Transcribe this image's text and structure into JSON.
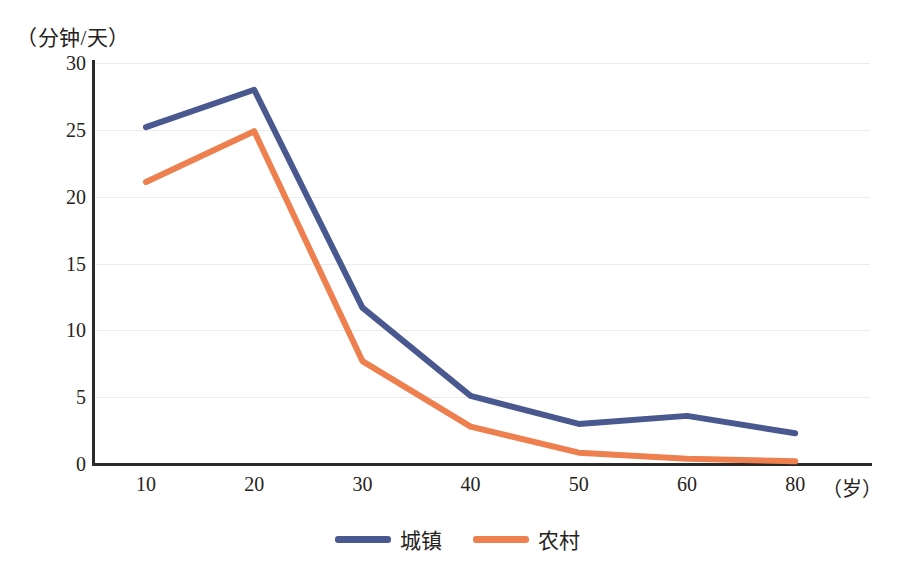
{
  "chart_data": {
    "type": "line",
    "title": "",
    "xlabel": "（岁）",
    "ylabel": "（分钟/天）",
    "categories": [
      "10",
      "20",
      "30",
      "40",
      "50",
      "60",
      "80"
    ],
    "x": [
      10,
      20,
      30,
      40,
      50,
      60,
      80
    ],
    "series": [
      {
        "name": "城镇",
        "color": "#4a5890",
        "values": [
          25.2,
          28.0,
          11.7,
          5.1,
          3.0,
          3.6,
          2.3
        ]
      },
      {
        "name": "农村",
        "color": "#ee7f4f",
        "values": [
          21.1,
          24.9,
          7.7,
          2.8,
          0.85,
          0.4,
          0.2
        ]
      }
    ],
    "ylim": [
      0,
      30
    ],
    "yticks": [
      0,
      5,
      10,
      15,
      20,
      25,
      30
    ],
    "ytick_labels": [
      "0",
      "5",
      "10",
      "15",
      "20",
      "25",
      "30"
    ],
    "grid": true,
    "grid_color": "#ececec",
    "axis_color": "#2c2a28",
    "legend_position": "bottom-center"
  },
  "axes": {
    "y_unit_caption": "（分钟/天）",
    "x_unit_caption": "（岁）"
  },
  "legend": {
    "items": [
      {
        "label": "城镇",
        "color": "#4a5890"
      },
      {
        "label": "农村",
        "color": "#ee7f4f"
      }
    ]
  }
}
